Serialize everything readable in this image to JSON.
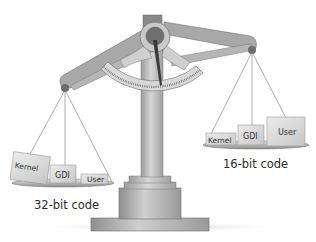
{
  "diagram": {
    "type": "balance-scale-illustration",
    "left_pan": {
      "caption": "32-bit code",
      "position": "lower (heavier)",
      "boxes": [
        {
          "label": "Kernel",
          "size": "large"
        },
        {
          "label": "GDI",
          "size": "medium"
        },
        {
          "label": "User",
          "size": "small"
        }
      ]
    },
    "right_pan": {
      "caption": "16-bit code",
      "position": "higher (lighter)",
      "boxes": [
        {
          "label": "Kernel",
          "size": "small"
        },
        {
          "label": "GDI",
          "size": "medium"
        },
        {
          "label": "User",
          "size": "large"
        }
      ]
    }
  },
  "colors": {
    "beam": "#a9a9a9",
    "beam_light": "#d2d2d2",
    "column": "#b5b5b5",
    "pivot_dark": "#6e6e6e",
    "box": "#dcdcdc",
    "text": "#2a2a2a"
  }
}
